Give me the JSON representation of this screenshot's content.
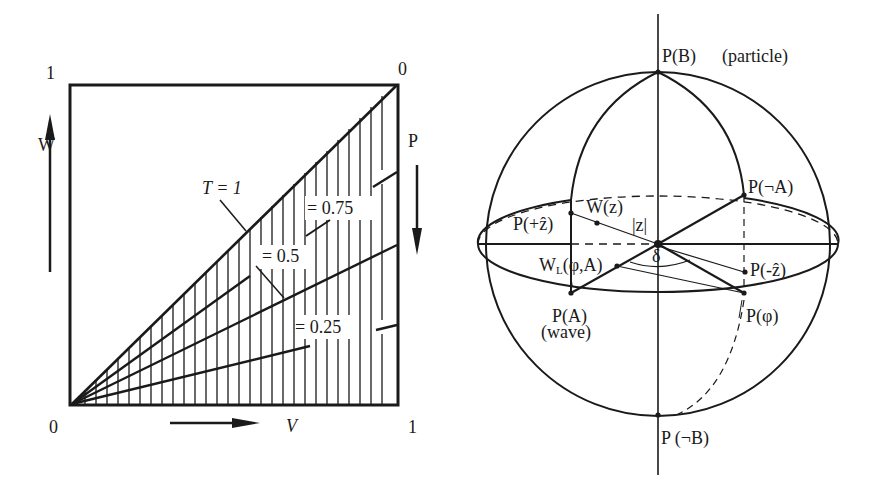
{
  "left_diagram": {
    "title": "WPV triangle square",
    "corner_labels": {
      "top_left": "1",
      "top_right": "0",
      "bottom_left": "0",
      "bottom_right": "1"
    },
    "axis_labels": {
      "left": "W",
      "right": "P",
      "bottom": "V"
    },
    "curves": [
      {
        "label": "T = 1",
        "slope": 1.0
      },
      {
        "label": "= 0.75",
        "slope": 0.75
      },
      {
        "label": "= 0.5",
        "slope": 0.5
      },
      {
        "label": "= 0.25",
        "slope": 0.25
      }
    ],
    "labels": {
      "t1": "T = 1",
      "t075": "= 0.75",
      "t05": "= 0.5",
      "t025": "= 0.25"
    },
    "hatching": "vertical lines under diagonal",
    "colors": {
      "ink": "#1a1a1a",
      "background": "#ffffff"
    }
  },
  "right_diagram": {
    "title": "Sphere with poles and equator",
    "labels": {
      "pB": "P(B)",
      "particle": "(particle)",
      "pNotA": "P(¬A)",
      "pPlusZ": "P(+ẑ)",
      "wz": "W(z)",
      "absz": "|z|",
      "wl": "W",
      "wl_sub": "L",
      "wl_args": "(φ,A)",
      "delta": "δ",
      "pMinusZ": "P(-ẑ)",
      "pA": "P(A)",
      "wave": "(wave)",
      "pPhi": "P(φ)",
      "pNotB": "P (¬B)"
    }
  }
}
